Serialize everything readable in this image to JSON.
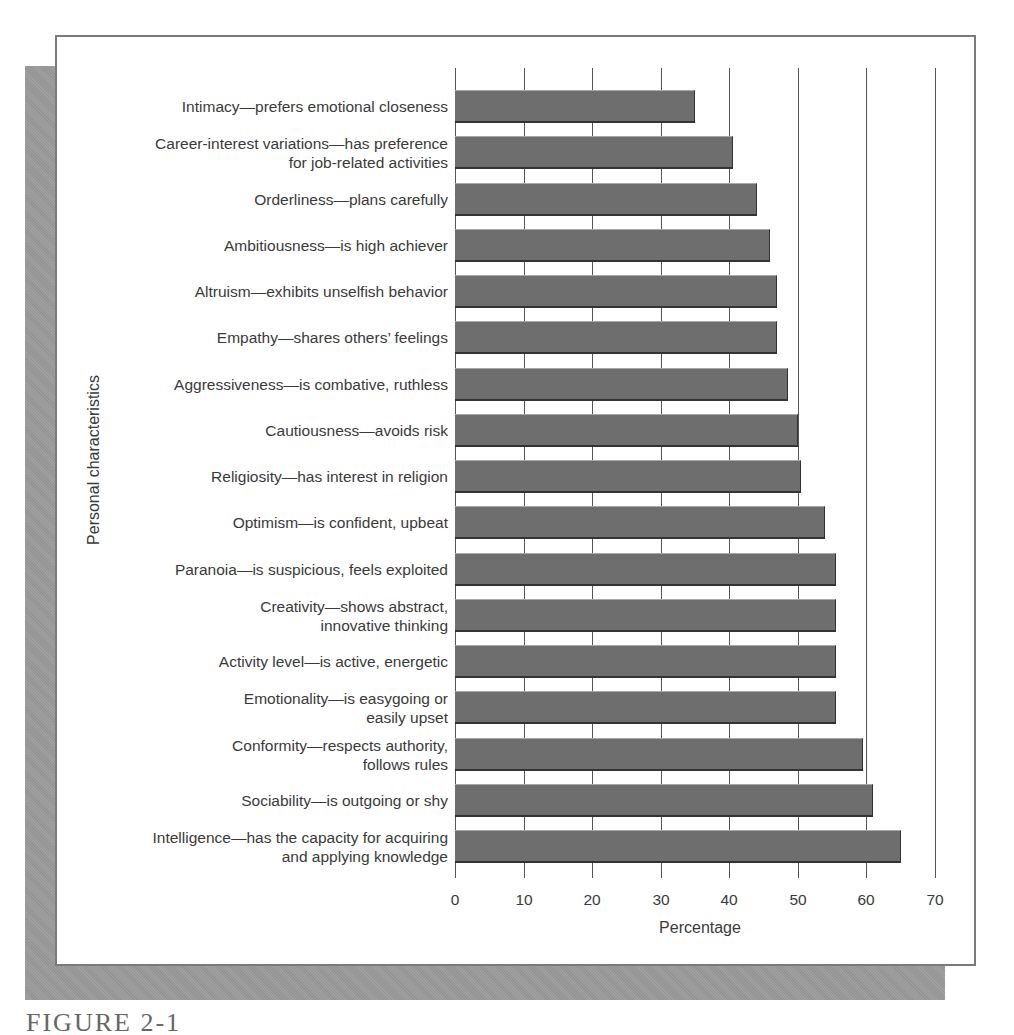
{
  "figure": {
    "caption": "FIGURE 2-1"
  },
  "chart_data": {
    "type": "bar",
    "orientation": "horizontal",
    "title": "",
    "xlabel": "Percentage",
    "ylabel": "Personal characteristics",
    "xlim": [
      0,
      70
    ],
    "xticks": [
      0,
      10,
      20,
      30,
      40,
      50,
      60,
      70
    ],
    "grid": "vertical lines at each tick",
    "categories": [
      "Intimacy—prefers emotional closeness",
      "Career-interest variations—has preference for job-related activities",
      "Orderliness—plans carefully",
      "Ambitiousness—is high achiever",
      "Altruism—exhibits unselfish behavior",
      "Empathy—shares others’ feelings",
      "Aggressiveness—is combative, ruthless",
      "Cautiousness—avoids risk",
      "Religiosity—has interest in religion",
      "Optimism—is confident, upbeat",
      "Paranoia—is suspicious, feels exploited",
      "Creativity—shows abstract, innovative thinking",
      "Activity level—is active, energetic",
      "Emotionality—is easygoing or easily upset",
      "Conformity—respects authority, follows rules",
      "Sociability—is outgoing or shy",
      "Intelligence—has the capacity for acquiring and applying knowledge"
    ],
    "values": [
      35,
      40.5,
      44,
      46,
      47,
      47,
      48.5,
      50,
      50.5,
      54,
      55.5,
      55.5,
      55.5,
      55.5,
      59.5,
      61,
      65
    ],
    "bar_color": "#6e6e6e"
  },
  "labels": [
    {
      "lines": [
        "Intimacy—prefers emotional closeness"
      ]
    },
    {
      "lines": [
        "Career-interest variations—has preference",
        "for job-related activities"
      ]
    },
    {
      "lines": [
        "Orderliness—plans carefully"
      ]
    },
    {
      "lines": [
        "Ambitiousness—is high achiever"
      ]
    },
    {
      "lines": [
        "Altruism—exhibits unselfish behavior"
      ]
    },
    {
      "lines": [
        "Empathy—shares others’ feelings"
      ]
    },
    {
      "lines": [
        "Aggressiveness—is combative, ruthless"
      ]
    },
    {
      "lines": [
        "Cautiousness—avoids risk"
      ]
    },
    {
      "lines": [
        "Religiosity—has interest in religion"
      ]
    },
    {
      "lines": [
        "Optimism—is confident, upbeat"
      ]
    },
    {
      "lines": [
        "Paranoia—is suspicious, feels exploited"
      ]
    },
    {
      "lines": [
        "Creativity—shows abstract,",
        "innovative thinking"
      ]
    },
    {
      "lines": [
        "Activity level—is active, energetic"
      ]
    },
    {
      "lines": [
        "Emotionality—is easygoing or",
        "easily upset"
      ]
    },
    {
      "lines": [
        "Conformity—respects authority,",
        "follows rules"
      ]
    },
    {
      "lines": [
        "Sociability—is outgoing or shy"
      ]
    },
    {
      "lines": [
        "Intelligence—has the capacity for acquiring",
        "and applying knowledge"
      ]
    }
  ],
  "axis": {
    "x_title": "Percentage",
    "y_title": "Personal characteristics",
    "ticks": [
      "0",
      "10",
      "20",
      "30",
      "40",
      "50",
      "60",
      "70"
    ]
  }
}
